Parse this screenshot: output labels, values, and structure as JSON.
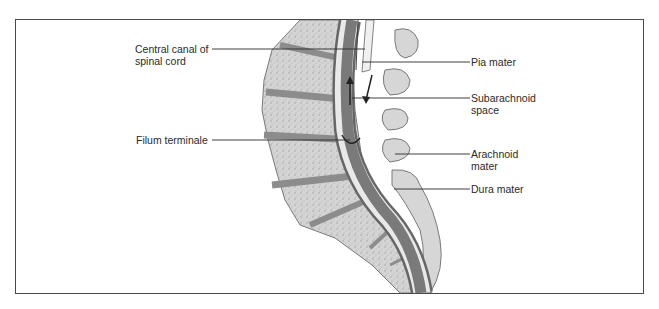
{
  "diagram": {
    "colors": {
      "frame": "#4a4a4a",
      "bone": "#d2d2d2",
      "bone_speckle": "#a9a9a9",
      "disc": "#8c8c8c",
      "cord_dark": "#7a7a7a",
      "cord_light": "#e9e9e9",
      "leader_line": "#2a2a2a"
    },
    "labels_left": [
      {
        "id": "central-canal",
        "line1": "Central canal of",
        "line2": "spinal cord"
      },
      {
        "id": "filum-terminale",
        "line1": "Filum terminale"
      }
    ],
    "labels_right": [
      {
        "id": "pia-mater",
        "line1": "Pia mater"
      },
      {
        "id": "subarachnoid-space",
        "line1": "Subarachnoid",
        "line2": "space"
      },
      {
        "id": "arachnoid-mater",
        "line1": "Arachnoid",
        "line2": "mater"
      },
      {
        "id": "dura-mater",
        "line1": "Dura mater"
      }
    ]
  }
}
